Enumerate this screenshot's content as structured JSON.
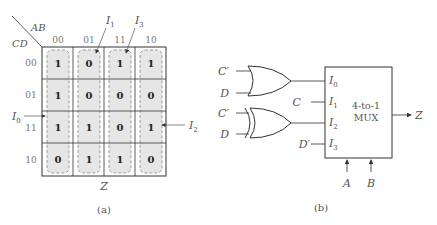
{
  "kmap": {
    "row_var": "CD",
    "col_var": "AB",
    "col_headers": [
      "00",
      "01",
      "11",
      "10"
    ],
    "row_headers": [
      "00",
      "01",
      "11",
      "10"
    ],
    "cells": [
      [
        "1",
        "0",
        "1",
        "1"
      ],
      [
        "1",
        "0",
        "0",
        "0"
      ],
      [
        "1",
        "1",
        "0",
        "1"
      ],
      [
        "0",
        "1",
        "1",
        "0"
      ]
    ],
    "output_label": "Z",
    "annotations": {
      "i0": "I0",
      "i1": "I1",
      "i2": "I2",
      "i3": "I3"
    },
    "caption": "(a)"
  },
  "circuit": {
    "or_gate_inputs": [
      "C′",
      "D"
    ],
    "xnor_gate_inputs": [
      "C′",
      "D"
    ],
    "mux_inputs": [
      "I0",
      "I1",
      "I2",
      "I3"
    ],
    "mux_direct_inputs": {
      "i1": "C",
      "i3": "D′"
    },
    "mux_label_line1": "4-to-1",
    "mux_label_line2": "MUX",
    "mux_output": "Z",
    "select_inputs": [
      "A",
      "B"
    ],
    "caption": "(b)"
  },
  "colors": {
    "cell_fill": "#e6e6e6",
    "grid_line": "#333333",
    "dashed_loop": "#888888",
    "label_gray": "#555555"
  }
}
